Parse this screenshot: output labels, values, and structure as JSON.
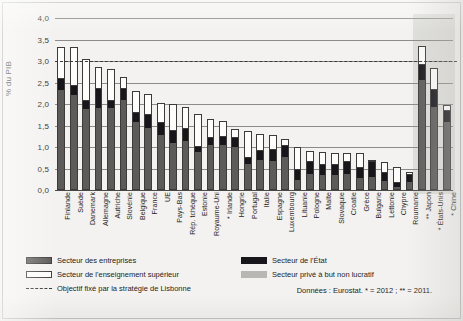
{
  "chart_data": {
    "type": "bar",
    "stacked": true,
    "title": "",
    "xlabel": "",
    "ylabel": "% du PIB",
    "ylim": [
      0,
      4.0
    ],
    "ytick_labels": [
      "0,0",
      "0,5",
      "1,0",
      "1,5",
      "2,0",
      "2,5",
      "3,0",
      "3,5",
      "4,0"
    ],
    "ytick_values": [
      0,
      0.5,
      1.0,
      1.5,
      2.0,
      2.5,
      3.0,
      3.5,
      4.0
    ],
    "grid": true,
    "legend_position": "bottom",
    "categories": [
      "Finlande",
      "Suède",
      "Danemark",
      "Allemagne",
      "Autriche",
      "Slovénie",
      "Belgique",
      "France",
      "UE",
      "Pays-Bas",
      "Rép. tchèque",
      "Estonie",
      "Royaume-Uni",
      "* Irlande",
      "Hongrie",
      "Portugal",
      "Italie",
      "Espagne",
      "Luxembourg",
      "Lituanie",
      "Pologne",
      "Malte",
      "Slovaquie",
      "Croatie",
      "Grèce",
      "Bulgarie",
      "Lettonie",
      "Chypre",
      "Roumanie",
      "** Japon",
      "* États-Unis",
      "* Chine"
    ],
    "series": [
      {
        "name": "Secteur des entreprises",
        "color": "#5d5b59",
        "values": [
          2.32,
          2.22,
          1.88,
          1.91,
          1.9,
          2.1,
          1.59,
          1.44,
          1.28,
          1.1,
          1.15,
          0.88,
          1.05,
          1.05,
          1.01,
          0.6,
          0.69,
          0.68,
          0.76,
          0.24,
          0.38,
          0.35,
          0.34,
          0.37,
          0.27,
          0.3,
          0.21,
          0.08,
          0.18,
          2.55,
          1.92,
          1.59
        ]
      },
      {
        "name": "Secteur de l'État",
        "color": "#17161a",
        "values": [
          0.26,
          0.19,
          0.19,
          0.44,
          0.16,
          0.24,
          0.21,
          0.31,
          0.27,
          0.28,
          0.26,
          0.11,
          0.15,
          0.19,
          0.2,
          0.15,
          0.21,
          0.24,
          0.26,
          0.22,
          0.27,
          0.23,
          0.25,
          0.28,
          0.25,
          0.35,
          0.18,
          0.08,
          0.18,
          0.35,
          0.4,
          0.24
        ]
      },
      {
        "name": "Secteur de l'enseignement supérieur",
        "color": "#fdfdfc",
        "values": [
          0.75,
          0.92,
          0.97,
          0.52,
          0.76,
          0.29,
          0.5,
          0.49,
          0.47,
          0.62,
          0.51,
          0.78,
          0.46,
          0.36,
          0.21,
          0.63,
          0.4,
          0.37,
          0.16,
          0.53,
          0.25,
          0.31,
          0.27,
          0.21,
          0.34,
          0.05,
          0.26,
          0.37,
          0.05,
          0.45,
          0.51,
          0.15
        ]
      },
      {
        "name": "Secteur privé à but non lucratif",
        "color": "#b9b7b4",
        "values": [
          0.0,
          0.0,
          0.0,
          0.0,
          0.0,
          0.0,
          0.0,
          0.0,
          0.0,
          0.0,
          0.0,
          0.0,
          0.0,
          0.0,
          0.0,
          0.0,
          0.0,
          0.0,
          0.0,
          0.0,
          0.0,
          0.0,
          0.0,
          0.0,
          0.0,
          0.0,
          0.0,
          0.0,
          0.0,
          0.0,
          0.0,
          0.0
        ]
      }
    ],
    "totals": [
      3.33,
      3.33,
      3.04,
      2.87,
      2.82,
      2.63,
      2.3,
      2.24,
      2.02,
      2.0,
      1.92,
      1.77,
      1.66,
      1.6,
      1.42,
      1.38,
      1.3,
      1.29,
      1.18,
      0.99,
      0.9,
      0.89,
      0.86,
      0.86,
      0.86,
      0.7,
      0.65,
      0.53,
      0.41,
      3.35,
      2.83,
      1.98
    ],
    "reference_line": {
      "label": "Objectif fixé par la stratégie de Lisbonne",
      "value": 3.0,
      "style": "dashed",
      "color": "#3a3836"
    },
    "shaded_region": {
      "from_category": "** Japon",
      "to_category": "* Chine",
      "color": "#969491"
    },
    "annotations": {
      "source": "Données : Eurostat. * = 2012 ; ** = 2011."
    }
  },
  "legend": {
    "items": [
      {
        "label": "Secteur des entreprises",
        "swatch": "business"
      },
      {
        "label": "Secteur de l'enseignement supérieur",
        "swatch": "highered"
      },
      {
        "label": "Objectif fixé par la stratégie de Lisbonne",
        "swatch": "target"
      },
      {
        "label": "Secteur de l'État",
        "swatch": "state"
      },
      {
        "label": "Secteur privé à but non lucratif",
        "swatch": "nonprof"
      }
    ]
  }
}
